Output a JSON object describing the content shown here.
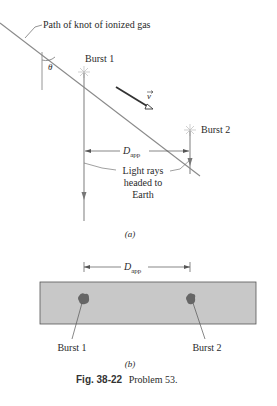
{
  "figure": {
    "panel_a": {
      "path_label": "Path of knot of ionized gas",
      "angle_symbol": "θ",
      "burst1_label": "Burst 1",
      "burst2_label": "Burst 2",
      "velocity_symbol": "v",
      "distance_symbol": "D",
      "distance_subscript": "app",
      "light_rays_line1": "Light rays",
      "light_rays_line2": "headed to",
      "light_rays_line3": "Earth",
      "panel_label": "(a)"
    },
    "panel_b": {
      "distance_symbol": "D",
      "distance_subscript": "app",
      "burst1_label": "Burst 1",
      "burst2_label": "Burst 2",
      "panel_label": "(b)"
    },
    "caption": {
      "fig_number": "Fig. 38-22",
      "text": "Problem 53."
    },
    "colors": {
      "line": "#8a8a8a",
      "arrow": "#555555",
      "plate": "#c8c8c8",
      "blob": "#6a6a6a"
    }
  }
}
